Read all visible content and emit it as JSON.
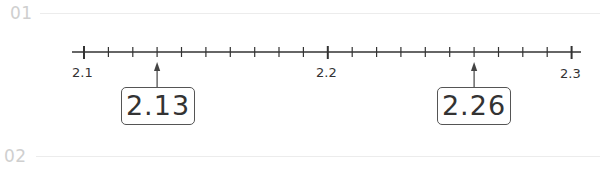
{
  "problems": [
    {
      "number": "01"
    },
    {
      "number": "02"
    }
  ],
  "number_line": {
    "start": 2.1,
    "end": 2.3,
    "minor_step": 0.01,
    "labels": [
      {
        "value": 2.1,
        "text": "2.1"
      },
      {
        "value": 2.2,
        "text": "2.2"
      },
      {
        "value": 2.3,
        "text": "2.3"
      }
    ],
    "markers": [
      {
        "value": 2.13,
        "text": "2.13"
      },
      {
        "value": 2.26,
        "text": "2.26"
      }
    ]
  },
  "colors": {
    "line": "#333333",
    "number": "#cfcfcf",
    "divider": "#ececec"
  }
}
